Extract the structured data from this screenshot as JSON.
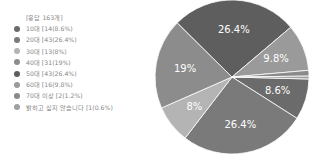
{
  "chart_data": {
    "type": "pie",
    "title": "[응답 163개]",
    "total": 163,
    "categories": [
      "10대",
      "20대",
      "30대",
      "40대",
      "50대",
      "60대",
      "70대 이상",
      "밝히고 싶지 않습니다"
    ],
    "values": [
      14,
      43,
      13,
      31,
      43,
      16,
      2,
      1
    ],
    "percents": [
      8.6,
      26.4,
      8,
      19,
      26.4,
      9.8,
      1.2,
      0.6
    ],
    "slice_labels": [
      "8.6%",
      "26.4%",
      "8%",
      "19%",
      "26.4%",
      "9.8%",
      "",
      ""
    ],
    "colors": [
      "#6b6b6b",
      "#7a7a7a",
      "#b4b4b4",
      "#8c8c8c",
      "#5e5e5e",
      "#9a9a9a",
      "#8a8a8a",
      "#a0a0a0"
    ],
    "legend_position": "left"
  },
  "legend": {
    "total": "[응답 163개]",
    "items": [
      {
        "label": "10대 [14(8.6%)"
      },
      {
        "label": "20대 [43(26.4%)"
      },
      {
        "label": "30대 [13(8%)"
      },
      {
        "label": "40대 [31(19%)"
      },
      {
        "label": "50대 [43(26.4%)"
      },
      {
        "label": "60대 [16(9.8%)"
      },
      {
        "label": "70대 이상 [2(1.2%)"
      },
      {
        "label": "밝히고 싶지 않습니다 [1(0.6%)"
      }
    ]
  }
}
